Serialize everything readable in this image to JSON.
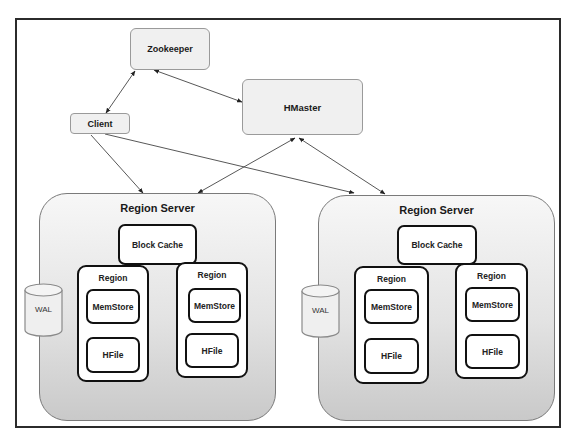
{
  "diagram": {
    "nodes": {
      "zookeeper": {
        "label": "Zookeeper"
      },
      "hmaster": {
        "label": "HMaster"
      },
      "client": {
        "label": "Client"
      }
    },
    "region_servers": [
      {
        "label": "Region Server",
        "block_cache": "Block Cache",
        "wal": "WAL",
        "regions": [
          {
            "label": "Region",
            "memstore": "MemStore",
            "hfile": "HFile"
          },
          {
            "label": "Region",
            "memstore": "MemStore",
            "hfile": "HFile"
          }
        ]
      },
      {
        "label": "Region Server",
        "block_cache": "Block Cache",
        "wal": "WAL",
        "regions": [
          {
            "label": "Region",
            "memstore": "MemStore",
            "hfile": "HFile"
          },
          {
            "label": "Region",
            "memstore": "MemStore",
            "hfile": "HFile"
          }
        ]
      }
    ],
    "edges": [
      {
        "from": "Zookeeper",
        "to": "Client",
        "type": "bidirectional"
      },
      {
        "from": "Zookeeper",
        "to": "HMaster",
        "type": "bidirectional"
      },
      {
        "from": "Client",
        "to": "Region Server 1",
        "type": "directed"
      },
      {
        "from": "Client",
        "to": "Region Server 2",
        "type": "directed"
      },
      {
        "from": "HMaster",
        "to": "Region Server 1",
        "type": "bidirectional"
      },
      {
        "from": "HMaster",
        "to": "Region Server 2",
        "type": "bidirectional"
      }
    ],
    "colors": {
      "frame_border": "#2b2b2b",
      "node_fill": "#f0f0f0",
      "node_border": "#9a9a9a",
      "region_server_fill_top": "#f7f7f7",
      "region_server_fill_bottom": "#c9c9c9",
      "inner_box_border": "#111111"
    }
  }
}
